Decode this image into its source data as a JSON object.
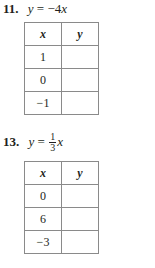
{
  "problems": [
    {
      "number": "11.",
      "equation_lhs": "y",
      "equals": "=",
      "coefficient": "−4",
      "variable": "x",
      "table": {
        "headers": [
          "x",
          "y"
        ],
        "rows": [
          [
            "1",
            ""
          ],
          [
            "0",
            ""
          ],
          [
            "−1",
            ""
          ]
        ]
      }
    },
    {
      "number": "13.",
      "equation_lhs": "y",
      "equals": "=",
      "fraction_numerator": "1",
      "fraction_denominator": "3",
      "variable": "x",
      "table": {
        "headers": [
          "x",
          "y"
        ],
        "rows": [
          [
            "0",
            ""
          ],
          [
            "6",
            ""
          ],
          [
            "−3",
            ""
          ]
        ]
      }
    }
  ]
}
